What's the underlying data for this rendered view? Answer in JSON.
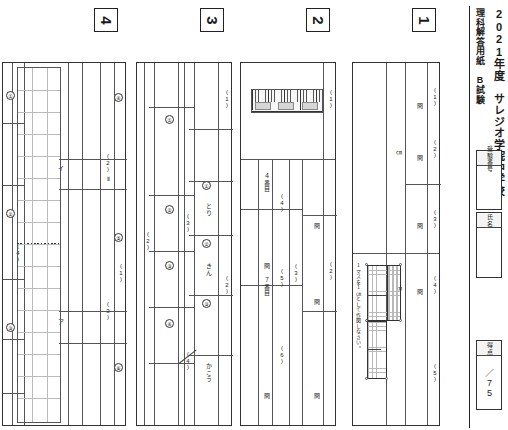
{
  "document": {
    "year_title": "2021年度　サレジオ学院中学校",
    "subject_title": "理科解答用紙　B試験"
  },
  "id_fields": {
    "exam_number_label": "受験番号",
    "exam_number_value": "",
    "name_label": "氏名",
    "name_value": "",
    "score_label": "得点",
    "score_value": "／75"
  },
  "sections": [
    {
      "id": "section-1",
      "badge": "1",
      "questions": [
        {
          "label": "(1)",
          "unit": "",
          "slots": 2
        },
        {
          "label": "(2)",
          "unit": "㎝",
          "slots": 1
        },
        {
          "label": "(3)",
          "unit": "",
          "slots": 1
        },
        {
          "label": "(4)",
          "unit": "㎝",
          "slots": 1
        },
        {
          "label": "(5)",
          "unit": "",
          "slots": 1
        }
      ],
      "figure": {
        "type": "grid-plot",
        "note": "１マスを１㎝として作図しなさい。"
      },
      "answer_marks": [
        "問",
        "問",
        "問",
        "問"
      ]
    },
    {
      "id": "section-2",
      "badge": "2",
      "questions": [
        {
          "label": "(1)",
          "unit": "",
          "slots": 1
        },
        {
          "label": "(2)",
          "unit": "",
          "slots": 1
        },
        {
          "label": "(3)",
          "unit": "",
          "slots": 1
        },
        {
          "label": "(4)",
          "unit": "",
          "slots": 1
        },
        {
          "label": "(5)",
          "unit": "",
          "slots": 1
        },
        {
          "label": "(6)",
          "unit": "",
          "slots": 1
        }
      ],
      "row_labels": [
        "４番目",
        "７番目"
      ],
      "figure": {
        "type": "ruler-scale"
      },
      "answer_marks": [
        "問",
        "問",
        "問",
        "問",
        "問",
        "問",
        "問"
      ]
    },
    {
      "id": "section-3",
      "badge": "3",
      "questions": [
        {
          "label": "(1)",
          "unit": "",
          "slots": 1
        },
        {
          "label": "(2)",
          "unit": "",
          "slots": 3
        },
        {
          "label": "(3)",
          "unit": "",
          "slots": 4
        },
        {
          "label": "(4)",
          "unit": "",
          "slots": 1
        }
      ],
      "circled": [
        "①",
        "②",
        "③",
        "④",
        "⑤",
        "①",
        "②",
        "③"
      ],
      "units": [
        "とり",
        "きん",
        "かこう"
      ]
    },
    {
      "id": "section-4",
      "badge": "4",
      "questions": [
        {
          "label": "(1)",
          "unit": "",
          "slots": 2
        },
        {
          "label": "(2)",
          "unit": "",
          "slots": 2
        },
        {
          "label": "(3)",
          "unit": "",
          "slots": 2
        },
        {
          "label": "(4)",
          "unit": "",
          "slots": 2
        }
      ],
      "choice_labels": [
        "ア",
        "イ"
      ],
      "circled": [
        "①",
        "②",
        "③",
        "④",
        "⑤",
        "⑥"
      ],
      "graph_note": "Ⅱ"
    }
  ]
}
